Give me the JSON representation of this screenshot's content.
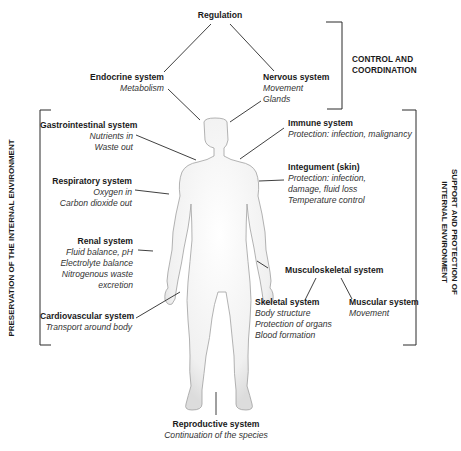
{
  "diagram": {
    "top": {
      "title": "Regulation"
    },
    "groups": {
      "control": {
        "line1": "CONTROL AND",
        "line2": "COORDINATION"
      },
      "preservation": {
        "label": "PRESERVATION OF THE INTERNAL ENVIRONMENT"
      },
      "support": {
        "line1": "SUPPORT AND PROTECTION OF",
        "line2": "INTERNAL ENVIRONMENT"
      }
    },
    "systems": {
      "endocrine": {
        "title": "Endocrine system",
        "desc": [
          "Metabolism"
        ]
      },
      "nervous": {
        "title": "Nervous system",
        "desc": [
          "Movement",
          "Glands"
        ]
      },
      "gastrointestinal": {
        "title": "Gastrointestinal system",
        "desc": [
          "Nutrients in",
          "Waste out"
        ]
      },
      "respiratory": {
        "title": "Respiratory system",
        "desc": [
          "Oxygen in",
          "Carbon dioxide out"
        ]
      },
      "renal": {
        "title": "Renal system",
        "desc": [
          "Fluid balance, pH",
          "Electrolyte balance",
          "Nitrogenous waste",
          "excretion"
        ]
      },
      "cardiovascular": {
        "title": "Cardiovascular system",
        "desc": [
          "Transport around body"
        ]
      },
      "immune": {
        "title": "Immune system",
        "desc": [
          "Protection: infection, malignancy"
        ]
      },
      "integument": {
        "title": "Integument (skin)",
        "desc": [
          "Protection: infection,",
          "damage, fluid loss",
          "Temperature control"
        ]
      },
      "musculoskeletal": {
        "title": "Musculoskeletal system",
        "desc": []
      },
      "skeletal": {
        "title": "Skeletal system",
        "desc": [
          "Body structure",
          "Protection of organs",
          "Blood formation"
        ]
      },
      "muscular": {
        "title": "Muscular system",
        "desc": [
          "Movement"
        ]
      },
      "reproductive": {
        "title": "Reproductive system",
        "desc": [
          "Continuation of the species"
        ]
      }
    },
    "colors": {
      "line": "#2a2a2a",
      "figure_fill": "#f1f1f1",
      "figure_stroke": "#9a9a9a"
    }
  }
}
